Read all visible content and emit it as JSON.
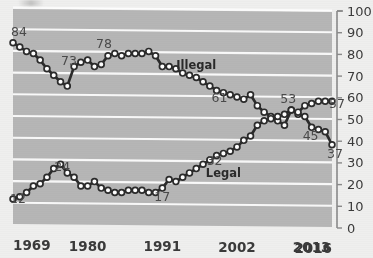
{
  "chart_data": {
    "type": "line",
    "title": "",
    "subtitle": "",
    "xlabel": "",
    "ylabel": "",
    "ylim": [
      0,
      100
    ],
    "xlim": [
      1969,
      2016
    ],
    "grid": true,
    "legend_position": "inline-annotation",
    "y_ticks": [
      0,
      10,
      20,
      30,
      40,
      50,
      60,
      70,
      80,
      90,
      100
    ],
    "y_tick_labels": [
      "0",
      "10",
      "20",
      "30",
      "40",
      "50",
      "60",
      "70",
      "80",
      "90",
      "100"
    ],
    "y_axis_side": "right",
    "x_ticks": [
      1969,
      1980,
      1991,
      2002,
      2013,
      2016
    ],
    "x_tick_labels": [
      "1969",
      "1980",
      "1991",
      "2002",
      "2013",
      "2016"
    ],
    "x": [
      1969,
      1970,
      1971,
      1972,
      1973,
      1974,
      1975,
      1976,
      1977,
      1978,
      1979,
      1980,
      1981,
      1982,
      1983,
      1984,
      1985,
      1986,
      1987,
      1988,
      1989,
      1990,
      1991,
      1992,
      1993,
      1994,
      1995,
      1996,
      1997,
      1998,
      1999,
      2000,
      2001,
      2002,
      2003,
      2004,
      2005,
      2006,
      2007,
      2008,
      2009,
      2010,
      2011,
      2012,
      2013,
      2014,
      2015,
      2016
    ],
    "series": [
      {
        "name": "Illegal",
        "color": "#2b2b2b",
        "values": [
          84,
          82,
          80,
          79,
          76,
          72,
          69,
          66,
          64,
          73,
          75,
          76,
          73,
          74,
          78,
          79,
          78,
          79,
          79,
          79,
          80,
          78,
          73,
          73,
          72,
          70,
          69,
          68,
          66,
          64,
          62,
          61,
          60,
          59,
          58,
          60,
          55,
          52,
          50,
          48,
          46,
          53,
          51,
          50,
          45,
          44,
          43,
          37
        ]
      },
      {
        "name": "Legal",
        "color": "#2b2b2b",
        "values": [
          12,
          13,
          15,
          18,
          19,
          22,
          26,
          28,
          24,
          22,
          18,
          18,
          20,
          17,
          16,
          15,
          15,
          16,
          16,
          16,
          15,
          15,
          17,
          21,
          20,
          22,
          24,
          26,
          28,
          30,
          32,
          33,
          34,
          36,
          39,
          41,
          46,
          48,
          49,
          50,
          51,
          53,
          52,
          55,
          56,
          57,
          57,
          57
        ]
      }
    ],
    "point_labels": [
      {
        "text": "84",
        "series": "Illegal",
        "x": 1969,
        "y": 84
      },
      {
        "text": "73",
        "series": "Illegal",
        "x": 1978,
        "y": 73
      },
      {
        "text": "78",
        "series": "Illegal",
        "x": 1983,
        "y": 78
      },
      {
        "text": "61",
        "series": "Illegal",
        "x": 2000,
        "y": 61
      },
      {
        "text": "53",
        "series": "Illegal",
        "x": 2010,
        "y": 53
      },
      {
        "text": "45",
        "series": "Illegal",
        "x": 2013,
        "y": 45
      },
      {
        "text": "37",
        "series": "Illegal",
        "x": 2016,
        "y": 37
      },
      {
        "text": "12",
        "series": "Legal",
        "x": 1969,
        "y": 12
      },
      {
        "text": "24",
        "series": "Legal",
        "x": 1977,
        "y": 24
      },
      {
        "text": "17",
        "series": "Legal",
        "x": 1991,
        "y": 17
      },
      {
        "text": "32",
        "series": "Legal",
        "x": 1999,
        "y": 32
      },
      {
        "text": "57",
        "series": "Legal",
        "x": 2016,
        "y": 57
      }
    ],
    "series_annotations": [
      {
        "text": "Illegal",
        "x": 1996,
        "y": 72
      },
      {
        "text": "Legal",
        "x": 2000,
        "y": 22
      }
    ],
    "colors": {
      "plot_background": "#b6b6b6",
      "page_background": "#efefee",
      "gridline": "#ffffff",
      "line": "#2b2b2b",
      "marker_fill": "#ffffff",
      "marker_stroke": "#2b2b2b",
      "axis": "#8a8a8a",
      "tick_label": "#3b3b3b"
    }
  },
  "labels": {
    "y_100": "100",
    "y_90": "90",
    "y_80": "80",
    "y_70": "70",
    "y_60": "60",
    "y_50": "50",
    "y_40": "40",
    "y_30": "30",
    "y_20": "20",
    "y_10": "10",
    "y_0": "0",
    "x_1969": "1969",
    "x_1980": "1980",
    "x_1991": "1991",
    "x_2002": "2002",
    "x_2013": "2013",
    "x_2016": "2016",
    "illegal": "Illegal",
    "legal": "Legal",
    "v84": "84",
    "v73": "73",
    "v78": "78",
    "v61": "61",
    "v53": "53",
    "v45": "45",
    "v37": "37",
    "v12": "12",
    "v24": "24",
    "v17": "17",
    "v32": "32",
    "v57": "57"
  }
}
